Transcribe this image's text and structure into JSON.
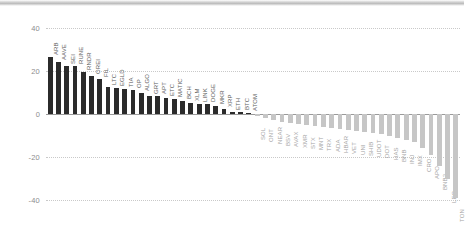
{
  "chart_data": {
    "type": "bar",
    "title": "",
    "subtitle": "",
    "xlabel": "",
    "ylabel": "",
    "ylim": [
      -40,
      40
    ],
    "yticks": [
      40,
      20,
      0,
      -20,
      -40
    ],
    "ytick_labels": [
      "40",
      "20",
      "0",
      "-20",
      "-40"
    ],
    "grid": true,
    "grid_style": "dotted-horizontal",
    "legend": false,
    "legend_position": "none",
    "orientation": "vertical",
    "label_rotation": 90,
    "sorted": "descending",
    "colors": {
      "positive_bar": "#2b2b2b",
      "negative_bar": "#c6c6c6",
      "gridline": "#c9c9c9",
      "zero_line": "#9a9a9a",
      "tick_label": "#8d8d8d",
      "positive_label": "#5d5d5d",
      "negative_label": "#a5a5a5",
      "background": "#ffffff",
      "top_strip": "#bdbdbd"
    },
    "categories": [
      "ARB",
      "AAVE",
      "SEI",
      "RUNE",
      "RNDR",
      "OREI",
      "FIL",
      "LTC",
      "EGLD",
      "TIA",
      "OP",
      "ALGO",
      "GRT",
      "APT",
      "ETC",
      "MATIC",
      "BCH",
      "XLM",
      "LINK",
      "DOGE",
      "MKR",
      "XRP",
      "ETH",
      "BTC",
      "ATOM",
      "SOL",
      "ONT",
      "NEAR",
      "BSV",
      "AVAX",
      "XMR",
      "STX",
      "MNT",
      "TRX",
      "ADA",
      "HBAR",
      "VET",
      "UNI",
      "SHIB",
      "UDOT",
      "DOT",
      "HAS",
      "BNB",
      "INJ",
      "IMX",
      "CRO",
      "APO",
      "BNB2",
      "LEO",
      "TON"
    ],
    "values": [
      26.5,
      24.0,
      22.5,
      22.3,
      19.5,
      17.5,
      16.5,
      12.5,
      12.3,
      11.5,
      11.0,
      10.0,
      8.5,
      8.3,
      7.5,
      7.0,
      6.0,
      5.0,
      4.8,
      4.5,
      3.5,
      2.5,
      1.0,
      0.8,
      0.5,
      -1.0,
      -2.0,
      -3.0,
      -3.5,
      -4.0,
      -4.5,
      -5.0,
      -5.5,
      -6.0,
      -6.5,
      -7.0,
      -7.5,
      -8.0,
      -8.5,
      -9.0,
      -9.5,
      -10.0,
      -11.0,
      -12.0,
      -13.0,
      -16.0,
      -19.0,
      -24.0,
      -30.0,
      -39.0
    ]
  }
}
